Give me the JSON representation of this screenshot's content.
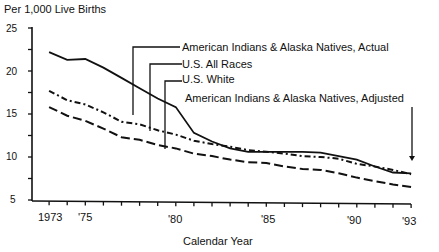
{
  "chart_data": {
    "type": "line",
    "title": "",
    "ylabel": "Per 1,000 Live Births",
    "xlabel": "Calendar Year",
    "ylim": [
      5,
      25
    ],
    "xlim": [
      1972,
      1993
    ],
    "yticks": [
      5,
      10,
      15,
      20,
      25
    ],
    "xtick_labels": [
      {
        "year": 1973,
        "label": "1973"
      },
      {
        "year": 1975,
        "label": "'75"
      },
      {
        "year": 1980,
        "label": "'80"
      },
      {
        "year": 1985,
        "label": "'85"
      },
      {
        "year": 1990,
        "label": "'90"
      },
      {
        "year": 1993,
        "label": "'93"
      }
    ],
    "grid": false,
    "legend_position": "callout labels upper right",
    "x": [
      1973,
      1974,
      1975,
      1976,
      1977,
      1978,
      1979,
      1980,
      1981,
      1982,
      1983,
      1984,
      1985,
      1986,
      1987,
      1988,
      1989,
      1990,
      1991,
      1992,
      1993
    ],
    "series": [
      {
        "name": "American Indians & Alaska Natives, Actual",
        "style": "solid",
        "values": [
          22.2,
          21.3,
          21.4,
          20.4,
          19.2,
          18.0,
          16.8,
          15.8,
          12.8,
          11.8,
          11.0,
          10.6,
          10.6,
          10.6,
          10.6,
          10.5,
          10.1,
          9.7,
          8.9,
          8.2,
          8.1
        ]
      },
      {
        "name": "U.S. All Races",
        "style": "dash-dot",
        "values": [
          17.7,
          16.6,
          16.1,
          15.2,
          14.1,
          13.8,
          13.1,
          12.6,
          11.9,
          11.5,
          11.2,
          10.8,
          10.6,
          10.4,
          10.1,
          10.0,
          9.8,
          9.2,
          8.9,
          8.5,
          8.0
        ]
      },
      {
        "name": "U.S. White",
        "style": "dashed",
        "values": [
          15.8,
          14.8,
          14.2,
          13.3,
          12.3,
          12.0,
          11.4,
          11.0,
          10.4,
          10.1,
          9.7,
          9.4,
          9.3,
          8.9,
          8.6,
          8.5,
          8.1,
          7.6,
          7.2,
          6.8,
          6.5
        ]
      },
      {
        "name": "American Indians & Alaska Natives, Adjusted",
        "style": "arrow-to-point",
        "values": [
          null,
          null,
          null,
          null,
          null,
          null,
          null,
          null,
          null,
          null,
          null,
          null,
          null,
          null,
          null,
          null,
          null,
          null,
          null,
          null,
          8.1
        ]
      }
    ]
  },
  "labels": {
    "ylabel": "Per 1,000 Live Births",
    "xlabel": "Calendar Year",
    "yticks": [
      "25",
      "20",
      "15",
      "10",
      "5"
    ],
    "xticks": [
      "1973",
      "'75",
      "'80",
      "'85",
      "'90",
      "'93"
    ],
    "legend": [
      "American Indians & Alaska Natives, Actual",
      "U.S. All Races",
      "U.S. White",
      "American Indians & Alaska Natives, Adjusted"
    ]
  }
}
